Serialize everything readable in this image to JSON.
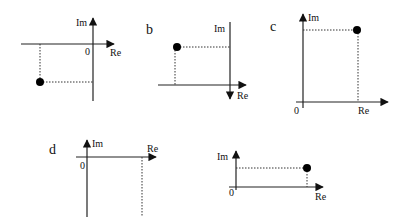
{
  "figure": {
    "panels": [
      {
        "id": "a",
        "panel_label": "",
        "im_label": "Im",
        "re_label": "Re",
        "origin_label": "0",
        "point_quadrant": "third (Re<0, Im<0)",
        "has_point": true
      },
      {
        "id": "b",
        "panel_label": "b",
        "im_label": "Im",
        "re_label": "Re",
        "origin_label": "",
        "point_quadrant": "Re<0, Im>0 (Im axis arrow points down)",
        "has_point": true
      },
      {
        "id": "c",
        "panel_label": "c",
        "im_label": "Im",
        "re_label": "Re",
        "origin_label": "0",
        "point_quadrant": "first (Re>0, Im>0)",
        "has_point": true
      },
      {
        "id": "d",
        "panel_label": "d",
        "im_label": "Im",
        "re_label": "Re",
        "origin_label": "0",
        "point_quadrant": "fourth (point off-canvas below)",
        "has_point": false
      },
      {
        "id": "e",
        "panel_label": "",
        "im_label": "Im",
        "re_label": "Re",
        "origin_label": "0",
        "point_quadrant": "first (Re>0, Im>0)",
        "has_point": true
      }
    ]
  },
  "colors": {
    "axis": "#222222",
    "point": "#000000",
    "background": "#ffffff"
  }
}
